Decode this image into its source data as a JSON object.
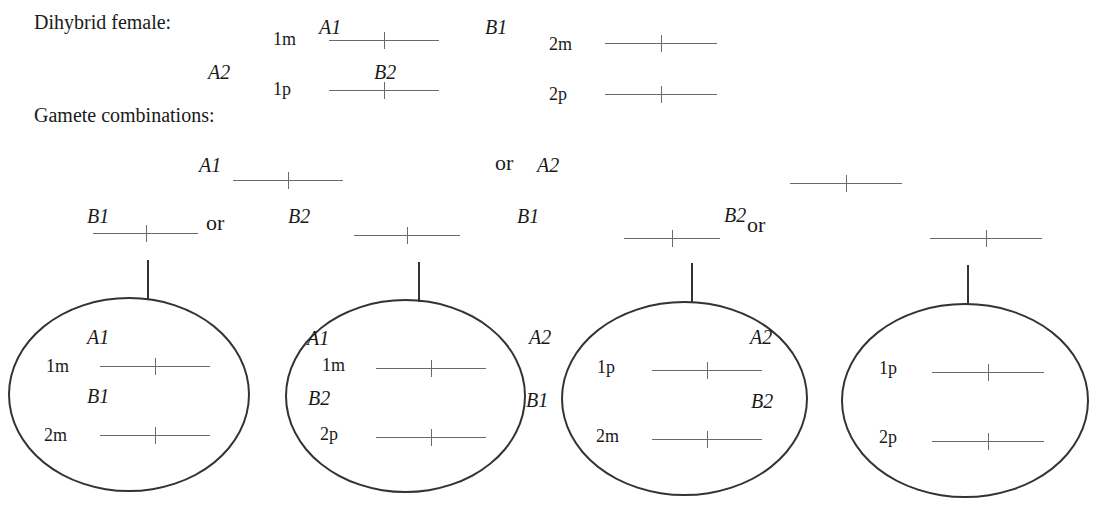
{
  "header": {
    "title": "Dihybrid female:",
    "gametes_title": "Gamete combinations:"
  },
  "parent": {
    "chromosomes": [
      {
        "locus": "1m",
        "allele": "A1"
      },
      {
        "locus": "1p",
        "allele": "A2"
      },
      {
        "locus": "2m",
        "allele": "B1"
      },
      {
        "locus": "2p",
        "allele": "B2"
      }
    ],
    "allele_labels": {
      "a1": "A1",
      "a2": "A2",
      "b1": "B1",
      "b2": "B2"
    }
  },
  "gamete_choices": {
    "a_options": [
      "A1",
      "A2"
    ],
    "b_options": [
      "B1",
      "B2",
      "B1",
      "B2"
    ],
    "or": "or"
  },
  "gametes": [
    {
      "chrom1": {
        "locus": "1m",
        "allele": "A1"
      },
      "chrom2": {
        "locus": "2m",
        "allele": "B1"
      }
    },
    {
      "chrom1": {
        "locus": "1m",
        "allele": "A1"
      },
      "chrom2": {
        "locus": "2p",
        "allele": "B2"
      }
    },
    {
      "chrom1": {
        "locus": "1p",
        "allele": "A2"
      },
      "chrom2": {
        "locus": "2m",
        "allele": "B1"
      }
    },
    {
      "chrom1": {
        "locus": "1p",
        "allele": "A2"
      },
      "chrom2": {
        "locus": "2p",
        "allele": "B2"
      }
    }
  ]
}
